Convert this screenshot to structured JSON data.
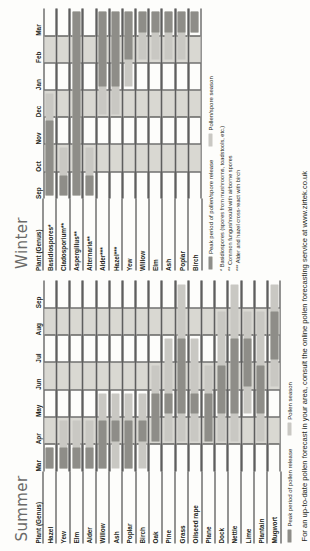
{
  "chart_data": {
    "type": "bar",
    "legend": {
      "position": "below-table",
      "entries": [
        {
          "key": "peak",
          "label_summer": "Peak period of pollen release",
          "label_winter": "Peak period of pollen/spore release",
          "color": "#8e8d88"
        },
        {
          "key": "season",
          "label_summer": "Pollen season",
          "label_winter": "Pollen/spore season",
          "color": "#c9c8c3"
        }
      ]
    },
    "panels": [
      {
        "id": "summer",
        "title": "Summer",
        "column_header": "Plant (Genus)",
        "months": [
          "Mar",
          "Apr",
          "May",
          "Jun",
          "Jul",
          "Aug",
          "Sep"
        ],
        "xlim": [
          "Mar",
          "Sep"
        ],
        "rows": [
          {
            "name": "Hazel",
            "season": [
              "Mar",
              "Mar"
            ],
            "peak": [
              "Mar",
              "Mar"
            ]
          },
          {
            "name": "Yew",
            "season": [
              "Mar",
              "Apr"
            ],
            "peak": [
              "Mar",
              "Mar"
            ]
          },
          {
            "name": "Elm",
            "season": [
              "Mar",
              "Apr"
            ],
            "peak": [
              "Mar",
              "Mar"
            ]
          },
          {
            "name": "Alder",
            "season": [
              "Mar",
              "Apr"
            ],
            "peak": [
              "Mar",
              "Mar"
            ]
          },
          {
            "name": "Willow",
            "season": [
              "Mar",
              "May"
            ],
            "peak": [
              "Mar",
              "Apr"
            ]
          },
          {
            "name": "Ash",
            "season": [
              "Mar",
              "May"
            ],
            "peak": [
              "Apr",
              "Apr"
            ]
          },
          {
            "name": "Poplar",
            "season": [
              "Mar",
              "May"
            ],
            "peak": [
              "Mar",
              "Apr"
            ]
          },
          {
            "name": "Birch",
            "season": [
              "Mar",
              "May"
            ],
            "peak": [
              "Apr",
              "Apr"
            ]
          },
          {
            "name": "Oak",
            "season": [
              "Apr",
              "Jun"
            ],
            "peak": [
              "Apr",
              "May"
            ]
          },
          {
            "name": "Pine",
            "season": [
              "Apr",
              "Jul"
            ],
            "peak": [
              "May",
              "May"
            ]
          },
          {
            "name": "Grass",
            "season": [
              "Apr",
              "Sep"
            ],
            "peak": [
              "May",
              "Jul"
            ]
          },
          {
            "name": "Oilseed rape",
            "season": [
              "Apr",
              "Jul"
            ],
            "peak": [
              "May",
              "May"
            ]
          },
          {
            "name": "Plane",
            "season": [
              "Apr",
              "Jun"
            ],
            "peak": [
              "Apr",
              "May"
            ]
          },
          {
            "name": "Dock",
            "season": [
              "Apr",
              "Aug"
            ],
            "peak": [
              "May",
              "Jun"
            ]
          },
          {
            "name": "Nettle",
            "season": [
              "Apr",
              "Sep"
            ],
            "peak": [
              "May",
              "Jul"
            ]
          },
          {
            "name": "Lime",
            "season": [
              "May",
              "Aug"
            ],
            "peak": [
              "Jun",
              "Jul"
            ]
          },
          {
            "name": "Plantain",
            "season": [
              "Apr",
              "Aug"
            ],
            "peak": [
              "May",
              "Jun"
            ]
          },
          {
            "name": "Mugwort",
            "season": [
              "Jun",
              "Sep"
            ],
            "peak": [
              "Jul",
              "Aug"
            ]
          }
        ]
      },
      {
        "id": "winter",
        "title": "Winter",
        "column_header": "Plant (Genus)",
        "months": [
          "Sep",
          "Oct",
          "Nov",
          "Dec",
          "Jan",
          "Feb",
          "Mar"
        ],
        "xlim": [
          "Sep",
          "Mar"
        ],
        "rows": [
          {
            "name": "Basidiospores*",
            "season": [
              "Sep",
              "Dec"
            ],
            "peak": [
              "Sep",
              "Nov"
            ]
          },
          {
            "name": "Cladosporium**",
            "season": [
              "Sep",
              "Oct"
            ],
            "peak": [
              "Sep",
              "Sep"
            ]
          },
          {
            "name": "Aspergillus**",
            "season": [
              "Sep",
              "Mar"
            ],
            "peak": [
              "Sep",
              "Mar"
            ]
          },
          {
            "name": "Alternaria**",
            "season": [
              "Sep",
              "Oct"
            ],
            "peak": [
              "Sep",
              "Sep"
            ]
          },
          {
            "name": "Alder***",
            "season": [
              "Dec",
              "Mar"
            ],
            "peak": [
              "Jan",
              "Mar"
            ]
          },
          {
            "name": "Hazel***",
            "season": [
              "Dec",
              "Mar"
            ],
            "peak": [
              "Jan",
              "Mar"
            ]
          },
          {
            "name": "Yew",
            "season": [
              "Jan",
              "Mar"
            ],
            "peak": [
              "Feb",
              "Mar"
            ]
          },
          {
            "name": "Willow",
            "season": [
              "Feb",
              "Mar"
            ],
            "peak": [
              "Mar",
              "Mar"
            ]
          },
          {
            "name": "Elm",
            "season": [
              "Feb",
              "Mar"
            ],
            "peak": [
              "Mar",
              "Mar"
            ]
          },
          {
            "name": "Ash",
            "season": [
              "Feb",
              "Mar"
            ],
            "peak": [
              "Mar",
              "Mar"
            ]
          },
          {
            "name": "Poplar",
            "season": [
              "Feb",
              "Mar"
            ],
            "peak": [
              "Mar",
              "Mar"
            ]
          },
          {
            "name": "Birch",
            "season": [
              "Mar",
              "Mar"
            ],
            "peak": [
              "Mar",
              "Mar"
            ]
          }
        ],
        "footnotes": [
          "* Basidiospores (spores from mushrooms, toadstools, etc.)",
          "** Common fungus/mould with airborne spores",
          "*** Alder and hazel cross-react with birch"
        ]
      }
    ]
  },
  "footer": {
    "text": "For an up-to-date pollen forecast in your area, consult the online pollen forecasting service at www.zirtek.co.uk"
  }
}
